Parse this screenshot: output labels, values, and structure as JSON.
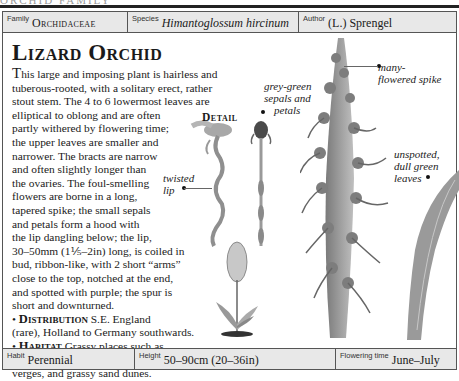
{
  "page_header_cut": "ORCHID FAMILY",
  "top_bar": {
    "family": {
      "label": "Family",
      "value": "Orchidaceae"
    },
    "species": {
      "label": "Species",
      "value": "Himantoglossum hircinum"
    },
    "author": {
      "label": "Author",
      "value": "(L.) Sprengel"
    }
  },
  "title": "Lizard Orchid",
  "description": {
    "dropcap": "T",
    "lines": [
      "his large and imposing plant is hairless and",
      "tuberous-rooted, with a solitary erect, rather",
      "stout stem. The 4 to 6 lowermost leaves are",
      "elliptical to oblong and are often",
      "partly withered by flowering time;",
      "the upper leaves are smaller and",
      "narrower. The bracts are narrow",
      "and often slightly longer than",
      "the ovaries. The foul-smelling",
      "flowers are borne in a long,",
      "tapered spike; the small sepals",
      "and petals form a hood with",
      "the lip dangling below; the lip,",
      "30–50mm (1⅕–2in) long, is coiled in",
      "bud, ribbon-like, with 2 short “arms”",
      "close to the top, notched at the end,",
      "and spotted with purple; the spur is",
      "short and downturned."
    ]
  },
  "distribution": {
    "bullet": "•",
    "heading": "Distribution",
    "line1": "S.E. England",
    "line2": "(rare), Holland to Germany southwards."
  },
  "habitat": {
    "bullet": "•",
    "heading": "Habitat",
    "line1": "Grassy places such as",
    "line2": "scrub and woodland margins, road",
    "line3": "verges, and grassy sand dunes."
  },
  "illustration": {
    "detail_label": "Detail",
    "annotations": {
      "sepals": [
        "grey-green",
        "sepals and",
        "petals"
      ],
      "lip": [
        "twisted",
        "lip"
      ],
      "spike": [
        "many-",
        "flowered spike"
      ],
      "leaves": [
        "unspotted,",
        "dull green",
        "leaves"
      ]
    },
    "colors": {
      "plant_dark": "#5a5a5a",
      "plant_mid": "#8a8a8a",
      "plant_light": "#bdbdbd",
      "leaf": "#9a9a9a"
    }
  },
  "bottom_bar": {
    "habit": {
      "label": "Habit",
      "value": "Perennial"
    },
    "height": {
      "label": "Height",
      "value": "50–90cm (20–36in)"
    },
    "flowering": {
      "label": "Flowering time",
      "value": "June–July"
    }
  }
}
